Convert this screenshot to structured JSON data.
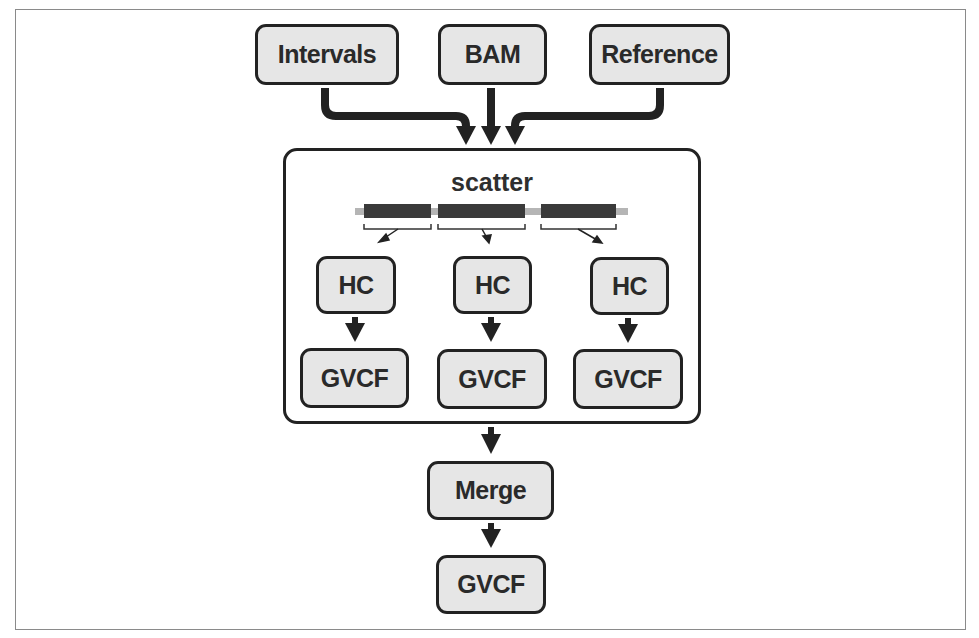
{
  "diagram": {
    "inputs": [
      {
        "id": "intervals",
        "label": "Intervals"
      },
      {
        "id": "bam",
        "label": "BAM"
      },
      {
        "id": "reference",
        "label": "Reference"
      }
    ],
    "scatter": {
      "title": "scatter",
      "shards": [
        {
          "hc_label": "HC",
          "gvcf_label": "GVCF"
        },
        {
          "hc_label": "HC",
          "gvcf_label": "GVCF"
        },
        {
          "hc_label": "HC",
          "gvcf_label": "GVCF"
        }
      ]
    },
    "merge": {
      "label": "Merge"
    },
    "output": {
      "label": "GVCF"
    },
    "colors": {
      "node_fill": "#e6e6e6",
      "stroke": "#222222",
      "interval_segment": "#3a3a3a",
      "genome_line": "#b5b5b5"
    }
  }
}
